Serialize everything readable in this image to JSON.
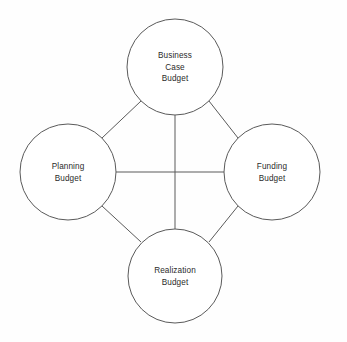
{
  "diagram": {
    "type": "circular-node-diagram",
    "background_color": "#fefefe",
    "stroke_color": "#5a5a5a",
    "text_color": "#2b2b2b",
    "nodes": [
      {
        "id": "business-case-budget",
        "label_lines": [
          "Business",
          "Case",
          "Budget"
        ],
        "line1": "Business",
        "line2": "Case",
        "line3": "Budget",
        "position": "top",
        "cx": 175,
        "cy": 67,
        "r": 48
      },
      {
        "id": "planning-budget",
        "label_lines": [
          "Planning",
          "Budget"
        ],
        "line1": "Planning",
        "line2": "Budget",
        "position": "left",
        "cx": 68,
        "cy": 172,
        "r": 48
      },
      {
        "id": "funding-budget",
        "label_lines": [
          "Funding",
          "Budget"
        ],
        "line1": "Funding",
        "line2": "Budget",
        "position": "right",
        "cx": 272,
        "cy": 172,
        "r": 48
      },
      {
        "id": "realization-budget",
        "label_lines": [
          "Realization",
          "Budget"
        ],
        "line1": "Realization",
        "line2": "Budget",
        "position": "bottom",
        "cx": 175,
        "cy": 276,
        "r": 47
      }
    ],
    "connectors": [
      {
        "id": "planning-to-funding",
        "kind": "horizontal",
        "x1": 116,
        "y1": 172,
        "x2": 224,
        "y2": 172
      },
      {
        "id": "business-case-to-realization",
        "kind": "vertical",
        "x1": 175,
        "y1": 115,
        "x2": 175,
        "y2": 229
      },
      {
        "id": "business-case-to-planning",
        "kind": "diagonal",
        "x1": 141,
        "y1": 101,
        "x2": 102,
        "y2": 138
      },
      {
        "id": "business-case-to-funding",
        "kind": "diagonal",
        "x1": 209,
        "y1": 101,
        "x2": 238,
        "y2": 138
      },
      {
        "id": "planning-to-realization",
        "kind": "diagonal",
        "x1": 102,
        "y1": 206,
        "x2": 141,
        "y2": 242
      },
      {
        "id": "funding-to-realization",
        "kind": "diagonal",
        "x1": 238,
        "y1": 206,
        "x2": 209,
        "y2": 242
      }
    ]
  }
}
